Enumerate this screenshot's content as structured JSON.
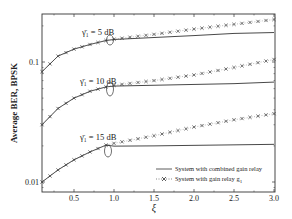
{
  "chart_data": {
    "type": "line",
    "title": "",
    "xlabel": "ξ",
    "ylabel": "Average BER, BPSK",
    "xlim": [
      0.1,
      3.0
    ],
    "ylim": [
      0.0075,
      0.2
    ],
    "yscale": "log",
    "grid": false,
    "legend_position": "lower right",
    "x_ticks": [
      0.5,
      1.0,
      1.5,
      2.0,
      2.5,
      3.0
    ],
    "x_tick_labels": [
      "0.5",
      "1.0",
      "1.5",
      "2.0",
      "2.5",
      "3.0"
    ],
    "y_ticks": [
      0.1,
      0.01
    ],
    "y_tick_labels": [
      "0.1",
      "0.01"
    ],
    "legend": [
      {
        "label": "System with combined gain relay",
        "style": "solid line"
      },
      {
        "label": "System with gain relay g",
        "subscript": "1",
        "style": "dotted with x markers"
      }
    ],
    "annotations": [
      {
        "text": "γ̄₁ = 5 dB",
        "x": 0.9,
        "curve": "5 dB"
      },
      {
        "text": "γ̄₁ = 10 dB",
        "x": 0.95,
        "curve": "10 dB"
      },
      {
        "text": "γ̄₁ = 15 dB",
        "x": 0.95,
        "curve": "15 dB"
      }
    ],
    "x": [
      0.1,
      0.3,
      0.5,
      0.7,
      0.9,
      1.0,
      1.5,
      2.0,
      2.5,
      3.0
    ],
    "series": [
      {
        "name": "System with combined gain relay (γ̄₁ = 5 dB)",
        "style": "solid",
        "values": [
          0.083,
          0.112,
          0.128,
          0.14,
          0.151,
          0.154,
          0.16,
          0.166,
          0.173,
          0.176
        ]
      },
      {
        "name": "System with gain relay g1 (γ̄₁ = 5 dB)",
        "style": "cross",
        "values": [
          0.083,
          0.112,
          0.128,
          0.14,
          0.151,
          0.155,
          0.17,
          0.188,
          0.206,
          0.226
        ]
      },
      {
        "name": "System with combined gain relay (γ̄₁ = 10 dB)",
        "style": "solid",
        "values": [
          0.03,
          0.041,
          0.05,
          0.057,
          0.062,
          0.063,
          0.064,
          0.065,
          0.066,
          0.068
        ]
      },
      {
        "name": "System with gain relay g1 (γ̄₁ = 10 dB)",
        "style": "cross",
        "values": [
          0.03,
          0.041,
          0.05,
          0.057,
          0.062,
          0.064,
          0.07,
          0.078,
          0.09,
          0.105
        ]
      },
      {
        "name": "System with combined gain relay (γ̄₁ = 15 dB)",
        "style": "solid",
        "values": [
          0.01,
          0.0126,
          0.0153,
          0.0178,
          0.0203,
          0.0199,
          0.02,
          0.0202,
          0.0204,
          0.0206
        ]
      },
      {
        "name": "System with gain relay g1 (γ̄₁ = 15 dB)",
        "style": "cross",
        "values": [
          0.01,
          0.0126,
          0.0153,
          0.0178,
          0.0203,
          0.021,
          0.0243,
          0.0287,
          0.033,
          0.0371
        ]
      }
    ]
  },
  "labels": {
    "ylabel": "Average BER, BPSK",
    "xlabel": "ξ",
    "curve_5db": "γ̄₁ = 5 dB",
    "curve_10db": "γ̄₁ = 10 dB",
    "curve_15db": "γ̄₁ = 15 dB",
    "legend_solid": "System with combined gain relay",
    "legend_cross": "System with gain relay g",
    "legend_cross_sub": "1"
  }
}
